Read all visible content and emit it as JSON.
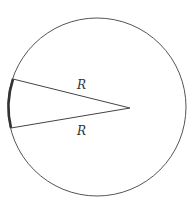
{
  "diagram": {
    "type": "circle-sector",
    "labels": {
      "upper_radius": "R",
      "lower_radius": "R"
    },
    "circle": {
      "cx": 97,
      "cy": 107,
      "r": 89,
      "stroke": "#555555"
    },
    "apex": {
      "x": 130,
      "y": 108
    },
    "chord_top": {
      "x": 13,
      "y": 79
    },
    "chord_bottom": {
      "x": 11,
      "y": 128
    },
    "arc_highlight_color": "#333333"
  }
}
